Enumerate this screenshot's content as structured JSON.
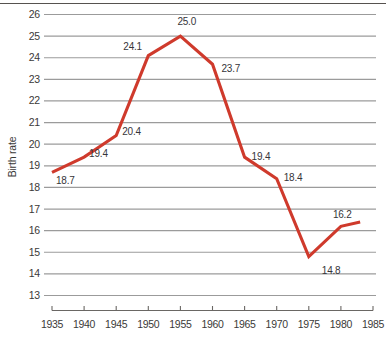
{
  "chart_data": {
    "type": "line",
    "title": "",
    "subtitle": "",
    "xlabel": "",
    "ylabel": "Birth rate",
    "x": [
      1935,
      1940,
      1945,
      1950,
      1955,
      1960,
      1965,
      1970,
      1975,
      1980,
      1983
    ],
    "values": [
      18.7,
      19.4,
      20.4,
      24.1,
      25.0,
      23.7,
      19.4,
      18.4,
      14.8,
      16.2,
      16.4
    ],
    "point_labels": [
      "18.7",
      "19.4",
      "20.4",
      "24.1",
      "25.0",
      "23.7",
      "19.4",
      "18.4",
      "14.8",
      "16.2",
      ""
    ],
    "series": [
      {
        "name": "Birth rate",
        "color": "#cf3a2c",
        "values": [
          18.7,
          19.4,
          20.4,
          24.1,
          25.0,
          23.7,
          19.4,
          18.4,
          14.8,
          16.2,
          16.4
        ]
      }
    ],
    "xlim": [
      1935,
      1985
    ],
    "ylim": [
      13,
      26
    ],
    "ytick_labels": [
      "26",
      "25",
      "24",
      "23",
      "22",
      "21",
      "20",
      "19",
      "18",
      "17",
      "16",
      "15",
      "14",
      "13"
    ],
    "ytick_values": [
      26,
      25,
      24,
      23,
      22,
      21,
      20,
      19,
      18,
      17,
      16,
      15,
      14,
      13
    ],
    "xtick_labels": [
      "1935",
      "1940",
      "1945",
      "1950",
      "1955",
      "1960",
      "1965",
      "1970",
      "1975",
      "1980",
      "1985"
    ],
    "xtick_values": [
      1935,
      1940,
      1945,
      1950,
      1955,
      1960,
      1965,
      1970,
      1975,
      1980,
      1985
    ],
    "grid": "horizontal",
    "legend": "none",
    "line_color": "#cf3a2c",
    "grid_color": "#9b9b9b",
    "axis_color": "#6a6764",
    "text_color": "#3b3a38"
  }
}
